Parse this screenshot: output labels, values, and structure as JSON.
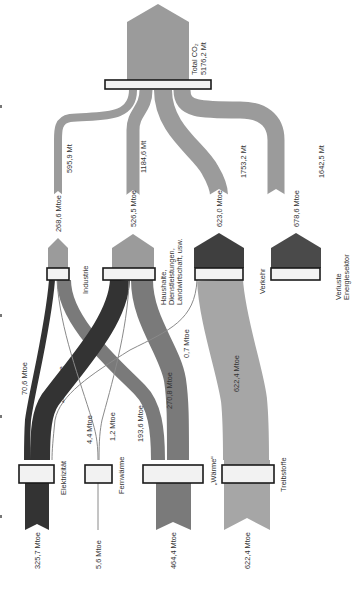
{
  "orientation": "rotated-90-clockwise",
  "colors": {
    "co2": "#9b9b9b",
    "elektrizitaet": "#3a3a3a",
    "waerme": "#7a7a7a",
    "fernwaerme_line": "#8a8a8a",
    "treibstoffe": "#a6a6a6",
    "verkehr": "#3f3f3f",
    "verluste": "#4a4a4a",
    "box_fill": "#f2f2f2",
    "box_stroke": "#1a1a1a",
    "text": "#333333"
  },
  "source": {
    "label_line1": "Total CO₂",
    "label_line2": "5176,2 Mt"
  },
  "co2_flows": [
    {
      "target": "Industrie",
      "value": "595,9 Mt"
    },
    {
      "target": "Haushalte",
      "value": "1184,6 Mt"
    },
    {
      "target": "Verkehr",
      "value": "1753,2 Mt"
    },
    {
      "target": "Verluste",
      "value": "1642,5 Mt"
    }
  ],
  "sectors": [
    {
      "id": "industrie",
      "label_lines": [
        "Industrie"
      ],
      "energy": "268,6 Mtoe"
    },
    {
      "id": "haushalte",
      "label_lines": [
        "Haushalte,",
        "Dienstleistungen,",
        "Landwirtschaft, usw."
      ],
      "energy": "526,5 Mtoe"
    },
    {
      "id": "verkehr",
      "label_lines": [
        "Verkehr"
      ],
      "energy": "623,0 Mtoe"
    },
    {
      "id": "verluste",
      "label_lines": [
        "Verluste",
        "Energiesektor"
      ],
      "energy": "678,6 Mtoe"
    }
  ],
  "carriers": [
    {
      "id": "elektrizitaet",
      "label": "Elektrizität",
      "total": "325,7 Mtoe"
    },
    {
      "id": "fernwaerme",
      "label": "Fernwärme",
      "total": "5,6 Mtoe"
    },
    {
      "id": "waerme",
      "label": "„Wärme“",
      "total": "464,4 Mtoe"
    },
    {
      "id": "treibstoffe",
      "label": "Treibstoffe",
      "total": "622,4 Mtoe"
    }
  ],
  "links": [
    {
      "from": "Industrie",
      "to": "Elektrizität",
      "value": "70,6 Mtoe"
    },
    {
      "from": "Haushalte",
      "to": "Elektrizität",
      "value": "254,5 Mtoe"
    },
    {
      "from": "Industrie",
      "to": "Fernwärme",
      "value": "4,4 Mtoe"
    },
    {
      "from": "Haushalte",
      "to": "Fernwärme",
      "value": "1,2 Mtoe"
    },
    {
      "from": "Industrie",
      "to": "Wärme",
      "value": "193,6 Mtoe"
    },
    {
      "from": "Haushalte",
      "to": "Wärme",
      "value": "270,8 Mtoe"
    },
    {
      "from": "Verkehr",
      "to": "Elektrizität",
      "value": "0,7 Mtoe"
    },
    {
      "from": "Verkehr",
      "to": "Treibstoffe",
      "value": "622,4 Mtoe"
    }
  ]
}
